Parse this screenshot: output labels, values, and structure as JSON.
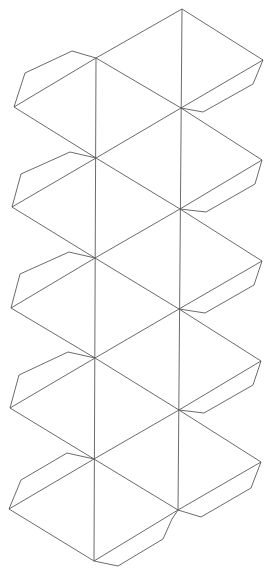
{
  "diagram": {
    "type": "icosahedron-net",
    "width": 274,
    "height": 569,
    "stroke_color": "#5a5a5a",
    "background": "#ffffff",
    "left_column": [
      [
        96,
        58
      ],
      [
        96,
        158
      ],
      [
        95,
        258
      ],
      [
        95,
        358
      ],
      [
        94,
        459
      ],
      [
        94,
        561
      ]
    ],
    "right_column": [
      [
        182,
        9
      ],
      [
        181,
        108
      ],
      [
        180,
        209
      ],
      [
        179,
        309
      ],
      [
        179,
        410
      ],
      [
        178,
        510
      ]
    ],
    "left_outer": [
      [
        14,
        107
      ],
      [
        12,
        207
      ],
      [
        11,
        308
      ],
      [
        10,
        408
      ],
      [
        9,
        509
      ]
    ],
    "right_outer": [
      [
        263,
        60
      ],
      [
        262,
        160
      ],
      [
        262,
        261
      ],
      [
        261,
        361
      ],
      [
        261,
        462
      ]
    ],
    "left_tabs": [
      [
        [
          96,
          58
        ],
        [
          72,
          51
        ],
        [
          25,
          73
        ],
        [
          14,
          107
        ]
      ],
      [
        [
          96,
          158
        ],
        [
          70,
          152
        ],
        [
          21,
          174
        ],
        [
          12,
          207
        ]
      ],
      [
        [
          95,
          258
        ],
        [
          69,
          252
        ],
        [
          20,
          274
        ],
        [
          11,
          308
        ]
      ],
      [
        [
          95,
          358
        ],
        [
          68,
          352
        ],
        [
          19,
          375
        ],
        [
          10,
          408
        ]
      ],
      [
        [
          94,
          459
        ],
        [
          67,
          453
        ],
        [
          21,
          480
        ],
        [
          9,
          509
        ]
      ]
    ],
    "right_tabs": [
      [
        [
          263,
          60
        ],
        [
          253,
          84
        ],
        [
          203,
          112
        ],
        [
          181,
          108
        ]
      ],
      [
        [
          262,
          160
        ],
        [
          255,
          184
        ],
        [
          206,
          212
        ],
        [
          180,
          209
        ]
      ],
      [
        [
          262,
          261
        ],
        [
          254,
          285
        ],
        [
          205,
          313
        ],
        [
          179,
          309
        ]
      ],
      [
        [
          261,
          361
        ],
        [
          253,
          385
        ],
        [
          204,
          413
        ],
        [
          179,
          410
        ]
      ],
      [
        [
          261,
          462
        ],
        [
          251,
          488
        ],
        [
          201,
          517
        ],
        [
          178,
          510
        ]
      ]
    ],
    "bottom_tab": [
      [
        94,
        561
      ],
      [
        118,
        566
      ],
      [
        163,
        539
      ],
      [
        172,
        519
      ],
      [
        178,
        510
      ]
    ]
  }
}
